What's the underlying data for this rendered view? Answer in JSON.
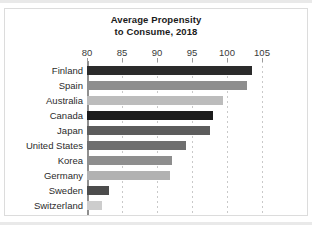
{
  "chart_data": {
    "type": "bar",
    "orientation": "horizontal",
    "title": "Average Propensity to Consume, 2018",
    "title_line1": "Average Propensity",
    "title_line2": "to Consume, 2018",
    "xlabel": "",
    "ylabel": "",
    "xlim": [
      80,
      107
    ],
    "axis_start": 80,
    "ticks": [
      80,
      85,
      90,
      95,
      100,
      105
    ],
    "tick_labels": [
      "80",
      "85",
      "90",
      "95",
      "100",
      "105"
    ],
    "grid": "vertical-dotted",
    "legend": "none",
    "categories": [
      "Finland",
      "Spain",
      "Australia",
      "Canada",
      "Japan",
      "United States",
      "Korea",
      "Germany",
      "Sweden",
      "Switzerland"
    ],
    "values": [
      103.5,
      102.8,
      99.4,
      98.0,
      97.5,
      94.2,
      92.2,
      91.8,
      83.2,
      82.1
    ],
    "bar_colors": [
      "#2b2b2b",
      "#8e8e8e",
      "#bcbcbc",
      "#1c1c1c",
      "#5c5c5c",
      "#6f6f6f",
      "#8e8e8e",
      "#b2b2b2",
      "#4c4c4c",
      "#cdcdcd"
    ],
    "bars": [
      {
        "label": "Finland",
        "value": 103.5,
        "color": "#2b2b2b"
      },
      {
        "label": "Spain",
        "value": 102.8,
        "color": "#8e8e8e"
      },
      {
        "label": "Australia",
        "value": 99.4,
        "color": "#bcbcbc"
      },
      {
        "label": "Canada",
        "value": 98.0,
        "color": "#1c1c1c"
      },
      {
        "label": "Japan",
        "value": 97.5,
        "color": "#5c5c5c"
      },
      {
        "label": "United States",
        "value": 94.2,
        "color": "#6f6f6f"
      },
      {
        "label": "Korea",
        "value": 92.2,
        "color": "#8e8e8e"
      },
      {
        "label": "Germany",
        "value": 91.8,
        "color": "#b2b2b2"
      },
      {
        "label": "Sweden",
        "value": 83.2,
        "color": "#4c4c4c"
      },
      {
        "label": "Switzerland",
        "value": 82.1,
        "color": "#cdcdcd"
      }
    ]
  },
  "style": {
    "background": "#ffffff",
    "frame_color": "#dcdcdc",
    "axis_color": "#8f8f8f",
    "grid_color": "#c9c9c9",
    "title_color": "#1b1b1b",
    "label_color": "#2b2b2b",
    "tick_color": "#3a3a3a",
    "band_color": "#e9e9e9"
  }
}
